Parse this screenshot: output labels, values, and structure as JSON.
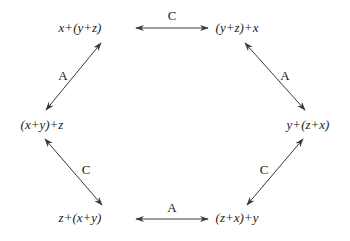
{
  "diagram": {
    "type": "hexagon-commutative-diagram",
    "nodes": [
      {
        "id": "tl",
        "label": "x+(y+z)",
        "x": 80,
        "y": 32
      },
      {
        "id": "tr",
        "label": "(y+z)+x",
        "x": 237,
        "y": 32
      },
      {
        "id": "l",
        "label": "(x+y)+z",
        "x": 42,
        "y": 129
      },
      {
        "id": "r",
        "label": "y+(z+x)",
        "x": 308,
        "y": 129
      },
      {
        "id": "bl",
        "label": "z+(x+y)",
        "x": 80,
        "y": 222
      },
      {
        "id": "br",
        "label": "(z+x)+y",
        "x": 237,
        "y": 222
      }
    ],
    "edges": [
      {
        "from": "tl",
        "to": "tr",
        "label": "C",
        "x1": 136,
        "y1": 28,
        "x2": 208,
        "y2": 28,
        "lx": 172,
        "ly": 20
      },
      {
        "from": "tl",
        "to": "l",
        "label": "A",
        "x1": 101,
        "y1": 43,
        "x2": 46,
        "y2": 110,
        "lx": 63,
        "ly": 80
      },
      {
        "from": "tr",
        "to": "r",
        "label": "A",
        "x1": 245,
        "y1": 43,
        "x2": 305,
        "y2": 110,
        "lx": 285,
        "ly": 80
      },
      {
        "from": "l",
        "to": "bl",
        "label": "C",
        "x1": 45,
        "y1": 139,
        "x2": 102,
        "y2": 205,
        "lx": 86,
        "ly": 174
      },
      {
        "from": "r",
        "to": "br",
        "label": "C",
        "x1": 303,
        "y1": 139,
        "x2": 247,
        "y2": 205,
        "lx": 264,
        "ly": 174
      },
      {
        "from": "bl",
        "to": "br",
        "label": "A",
        "x1": 136,
        "y1": 219,
        "x2": 208,
        "y2": 219,
        "lx": 172,
        "ly": 212
      }
    ]
  }
}
